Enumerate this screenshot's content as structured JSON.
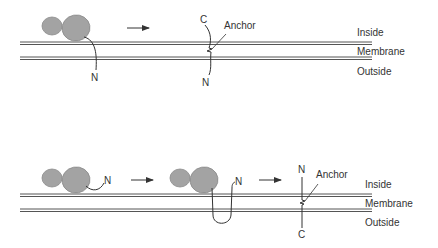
{
  "colors": {
    "membrane": "#555555",
    "protein_fill": "#a3a3a3",
    "protein_stroke": "#8a8a8a",
    "chain": "#333333",
    "text": "#333333"
  },
  "top_panel": {
    "step1": {
      "terminus_label": "N"
    },
    "step2": {
      "top_label": "C",
      "bottom_label": "N",
      "anchor_label": "Anchor"
    },
    "regions": {
      "inside": "Inside",
      "membrane": "Membrane",
      "outside": "Outside"
    }
  },
  "bottom_panel": {
    "step1": {
      "terminus_label": "N"
    },
    "step2": {
      "terminus_label": "N"
    },
    "step3": {
      "top_label": "N",
      "bottom_label": "C",
      "anchor_label": "Anchor"
    },
    "regions": {
      "inside": "Inside",
      "membrane": "Membrane",
      "outside": "Outside"
    }
  }
}
